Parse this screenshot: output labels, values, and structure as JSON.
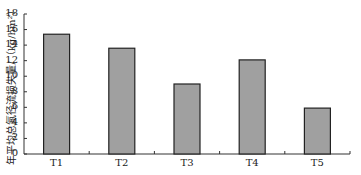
{
  "chart_data": {
    "type": "bar",
    "title": "",
    "xlabel": "",
    "ylabel": "年平均总氮径流损失量/（kg/hm²）",
    "categories": [
      "T1",
      "T2",
      "T3",
      "T4",
      "T5"
    ],
    "values": [
      15.4,
      13.6,
      9.0,
      12.1,
      5.9
    ],
    "ylim": [
      0,
      18
    ],
    "yticks": [
      0,
      2,
      4,
      6,
      8,
      10,
      12,
      14,
      16,
      18
    ],
    "grid": false,
    "bar_color": "#a0a0a0",
    "bar_edge_color": "#222222"
  }
}
